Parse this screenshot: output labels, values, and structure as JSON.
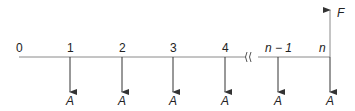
{
  "diagram": {
    "type": "cash-flow-timeline",
    "periods": [
      {
        "label": "0",
        "x": 19,
        "flow": null
      },
      {
        "label": "1",
        "x": 70,
        "flow": "A"
      },
      {
        "label": "2",
        "x": 122,
        "flow": "A"
      },
      {
        "label": "3",
        "x": 173,
        "flow": "A"
      },
      {
        "label": "4",
        "x": 225,
        "flow": "A"
      },
      {
        "label": "n − 1",
        "x": 278,
        "flow": "A"
      },
      {
        "label": "n",
        "x": 330,
        "flow": "A"
      }
    ],
    "break_symbol": "≀≀",
    "future_value_label": "F",
    "payment_label": "A",
    "colors": {
      "line": "#8a8a8a",
      "arrow": "#333333",
      "text": "#222222"
    }
  }
}
